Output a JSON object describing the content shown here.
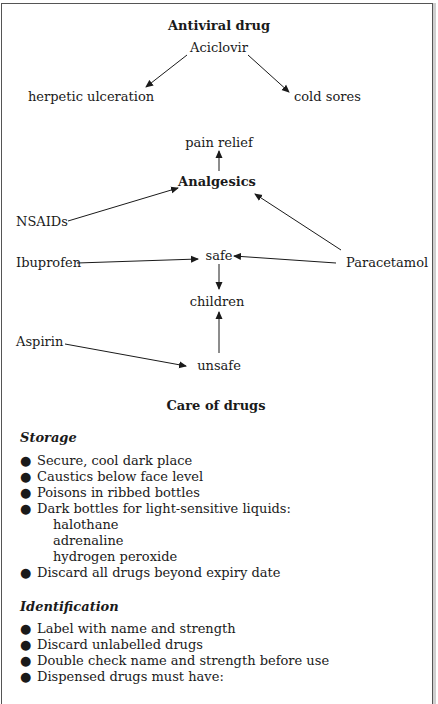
{
  "antiviral": {
    "title": "Antiviral drug",
    "drug": "Aciclovir",
    "uses": [
      "herpetic ulceration",
      "cold sores"
    ]
  },
  "analgesics": {
    "title": "Analgesics",
    "effect": "pain relief",
    "sources": [
      "NSAIDs",
      "Paracetamol"
    ],
    "ibuprofen": "Ibuprofen",
    "aspirin": "Aspirin",
    "safe": "safe",
    "unsafe": "unsafe",
    "children": "children"
  },
  "care": {
    "title": "Care of drugs",
    "storage": {
      "heading": "Storage",
      "items": [
        "Secure, cool dark place",
        "Caustics below face level",
        "Poisons in ribbed bottles",
        "Dark bottles for light-sensitive liquids:",
        "Discard all drugs beyond expiry date"
      ],
      "light_sensitive": [
        "halothane",
        "adrenaline",
        "hydrogen peroxide"
      ]
    },
    "identification": {
      "heading": "Identification",
      "items": [
        "Label with name and strength",
        "Discard unlabelled drugs",
        "Double check name and strength before use",
        "Dispensed drugs must have:"
      ]
    }
  },
  "bullet_glyph": "●"
}
